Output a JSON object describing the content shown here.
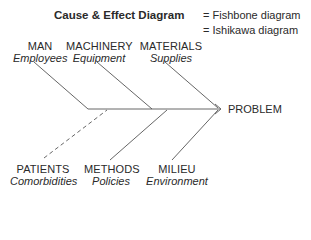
{
  "title": "Cause & Effect Diagram",
  "aliases": [
    "= Fishbone diagram",
    "= Ishikawa diagram"
  ],
  "effect": "PROBLEM",
  "top_causes": [
    {
      "category": "MAN",
      "description": "Employees"
    },
    {
      "category": "MACHINERY",
      "description": "Equipment"
    },
    {
      "category": "MATERIALS",
      "description": "Supplies"
    }
  ],
  "bottom_causes": [
    {
      "category": "PATIENTS",
      "description": "Comorbidities",
      "line_style": "dashed"
    },
    {
      "category": "METHODS",
      "description": "Policies",
      "line_style": "solid"
    },
    {
      "category": "MILIEU",
      "description": "Environment",
      "line_style": "solid"
    }
  ],
  "colors": {
    "line": "#555555",
    "text": "#2a2a2a",
    "background": "#ffffff"
  }
}
